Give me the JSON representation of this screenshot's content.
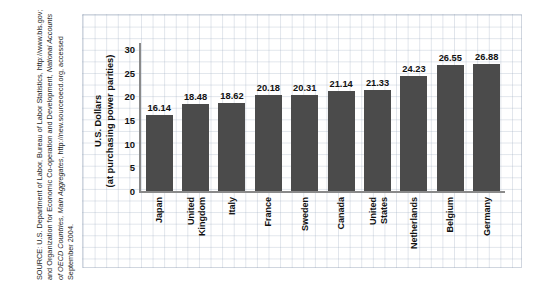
{
  "source_note": {
    "name": "source-note",
    "prefix": "SOURCE: U.S. Department of Labor, Bureau of Labor Statistics, http://www.bls.gov; and Organization for Economic Co-operation and Development, ",
    "italic": "National Accounts of OECD Countries, Main Aggregates",
    "suffix": ", http://new.sourceoecd.org, accessed September 2004."
  },
  "chart_data": {
    "type": "bar",
    "title": "",
    "xlabel": "",
    "ylabel": "U.S. Dollars (at purchasing power parities)",
    "ylabel_line1": "U.S. Dollars",
    "ylabel_line2": "(at purchasing power parities)",
    "ylim": [
      0,
      30
    ],
    "yticks": [
      0,
      5,
      10,
      15,
      20,
      25,
      30
    ],
    "ytick_labels": [
      "0",
      "5",
      "10",
      "15",
      "20",
      "25",
      "30"
    ],
    "grid": true,
    "legend": "none",
    "bar_color": "#4b4b4b",
    "axis_color": "#8a8a8a",
    "grid_color": "#9baabe",
    "categories": [
      "Japan",
      "United Kingdom",
      "Italy",
      "France",
      "Sweden",
      "Canada",
      "United States",
      "Netherlands",
      "Belgium",
      "Germany"
    ],
    "category_lines": [
      [
        "Japan"
      ],
      [
        "United",
        "Kingdom"
      ],
      [
        "Italy"
      ],
      [
        "France"
      ],
      [
        "Sweden"
      ],
      [
        "Canada"
      ],
      [
        "United",
        "States"
      ],
      [
        "Netherlands"
      ],
      [
        "Belgium"
      ],
      [
        "Germany"
      ]
    ],
    "values": [
      16.14,
      18.48,
      18.62,
      20.18,
      20.31,
      21.14,
      21.33,
      24.23,
      26.55,
      26.88
    ],
    "value_labels": [
      "16.14",
      "18.48",
      "18.62",
      "20.18",
      "20.31",
      "21.14",
      "21.33",
      "24.23",
      "26.55",
      "26.88"
    ]
  }
}
